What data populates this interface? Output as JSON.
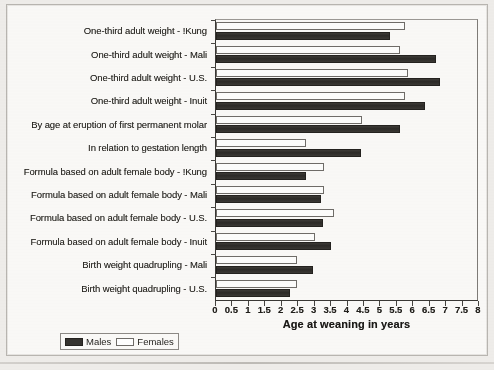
{
  "chart_data": {
    "type": "bar",
    "orientation": "horizontal",
    "title": "",
    "xlabel": "Age at weaning in years",
    "ylabel": "",
    "xlim": [
      0,
      8
    ],
    "xticks": [
      "0",
      "0.5",
      "1",
      "1.5",
      "2",
      "2.5",
      "3",
      "3.5",
      "4",
      "4.5",
      "5",
      "5.5",
      "6",
      "6.5",
      "7",
      "7.5",
      "8"
    ],
    "xtick_values": [
      0,
      0.5,
      1,
      1.5,
      2,
      2.5,
      3,
      3.5,
      4,
      4.5,
      5,
      5.5,
      6,
      6.5,
      7,
      7.5,
      8
    ],
    "grid": false,
    "legend_position": "below-left",
    "categories": [
      "One-third adult weight - !Kung",
      "One-third adult weight - Mali",
      "One-third adult weight - U.S.",
      "One-third adult weight - Inuit",
      "By age at eruption of first permanent molar",
      "In relation to gestation length",
      "Formula based on adult female body - !Kung",
      "Formula based on adult female body - Mali",
      "Formula based on adult female body - U.S.",
      "Formula based on adult female body - Inuit",
      "Birth weight quadrupling - Mali",
      "Birth weight quadrupling - U.S."
    ],
    "series": [
      {
        "name": "Females",
        "color": "#ffffff",
        "values": [
          5.75,
          5.6,
          5.85,
          5.75,
          4.45,
          2.75,
          3.3,
          3.3,
          3.6,
          3.0,
          2.45,
          2.45
        ]
      },
      {
        "name": "Males",
        "color": "#35332f",
        "values": [
          5.3,
          6.7,
          6.8,
          6.35,
          5.6,
          4.4,
          2.75,
          3.2,
          3.25,
          3.5,
          2.95,
          2.25
        ]
      }
    ]
  },
  "axis": {
    "x_title": "Age at weaning in years"
  },
  "legend": {
    "males_label": "Males",
    "females_label": "Females"
  }
}
